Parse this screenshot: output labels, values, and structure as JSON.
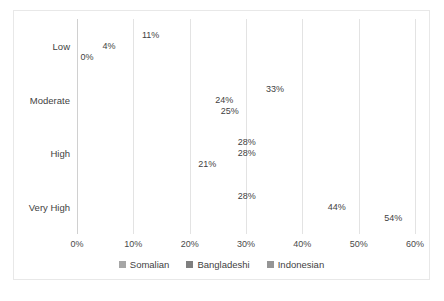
{
  "chart_data": {
    "type": "bar",
    "orientation": "horizontal",
    "title": "",
    "xlabel": "",
    "ylabel": "",
    "xlim": [
      0,
      60
    ],
    "xticks": [
      "0%",
      "10%",
      "20%",
      "30%",
      "40%",
      "50%",
      "60%"
    ],
    "xtick_values": [
      0,
      10,
      20,
      30,
      40,
      50,
      60
    ],
    "grid": true,
    "legend_position": "bottom",
    "categories": [
      "Low",
      "Moderate",
      "High",
      "Very High"
    ],
    "series": [
      {
        "name": "Somalian",
        "color": "#a6a6a6",
        "values": [
          11,
          33,
          28,
          28
        ],
        "labels": [
          "11%",
          "33%",
          "28%",
          "28%"
        ]
      },
      {
        "name": "Bangladeshi",
        "color": "#7f7f7f",
        "values": [
          4,
          24,
          28,
          44
        ],
        "labels": [
          "4%",
          "24%",
          "28%",
          "44%"
        ]
      },
      {
        "name": "Indonesian",
        "color": "#959595",
        "values": [
          0,
          25,
          21,
          54
        ],
        "labels": [
          "0%",
          "25%",
          "21%",
          "54%"
        ]
      }
    ]
  },
  "caption": ""
}
